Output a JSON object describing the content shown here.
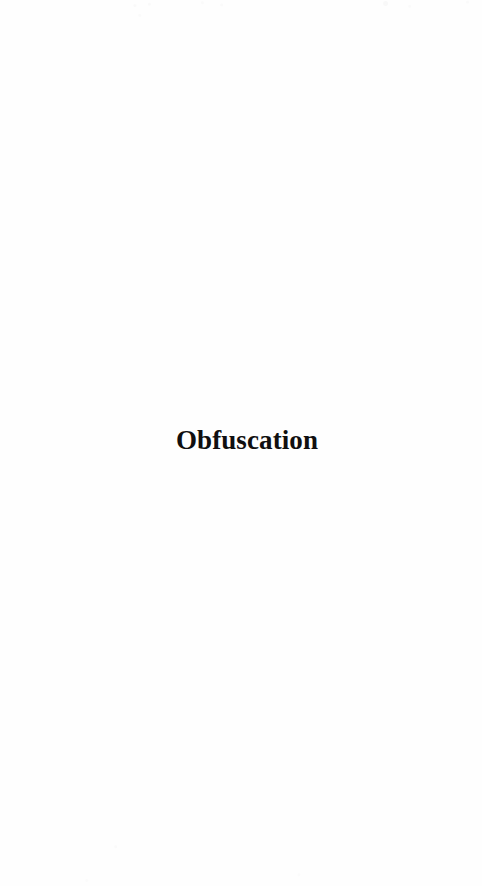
{
  "document": {
    "page_background_color": "#fefefe",
    "title_text_color": "#100f10",
    "part_title": "Obfuscation"
  }
}
